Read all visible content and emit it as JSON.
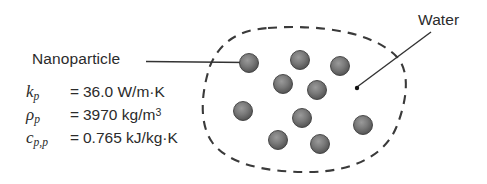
{
  "figure": {
    "background_color": "#ffffff",
    "ink_color": "#231f20"
  },
  "labels": {
    "nanoparticle": "Nanoparticle",
    "water": "Water"
  },
  "properties": [
    {
      "symbol_base": "k",
      "symbol_sub": "p",
      "equals": "=",
      "value": "36.0 W/m·K",
      "value_sup": ""
    },
    {
      "symbol_base": "ρ",
      "symbol_sub": "p",
      "equals": "=",
      "value": "3970 kg/m",
      "value_sup": "3"
    },
    {
      "symbol_base": "c",
      "symbol_sub": "p,p",
      "equals": "=",
      "value": "0.765 kJ/kg·K",
      "value_sup": ""
    }
  ],
  "diagram": {
    "boundary": {
      "style": "dashed",
      "stroke_color": "#3a3a3a",
      "stroke_width": 2.1,
      "dash_pattern": "9 7"
    },
    "particles": {
      "count": 11,
      "fill_color": "#6e6e6e",
      "edge_color": "#3d3d3d",
      "radius": 9.5,
      "centers": [
        [
          249,
          63
        ],
        [
          300,
          60
        ],
        [
          340,
          66
        ],
        [
          283,
          84
        ],
        [
          317,
          90
        ],
        [
          243,
          111
        ],
        [
          302,
          118
        ],
        [
          363,
          125
        ],
        [
          278,
          140
        ],
        [
          320,
          144
        ]
      ]
    },
    "leaders": [
      {
        "name": "nanoparticle-leader",
        "from": [
          146,
          61
        ],
        "to": [
          247,
          62
        ],
        "endpoint_marker": "dot"
      },
      {
        "name": "water-leader",
        "from": [
          430,
          33
        ],
        "to": [
          357,
          88
        ],
        "endpoint_marker": "dot"
      }
    ]
  }
}
